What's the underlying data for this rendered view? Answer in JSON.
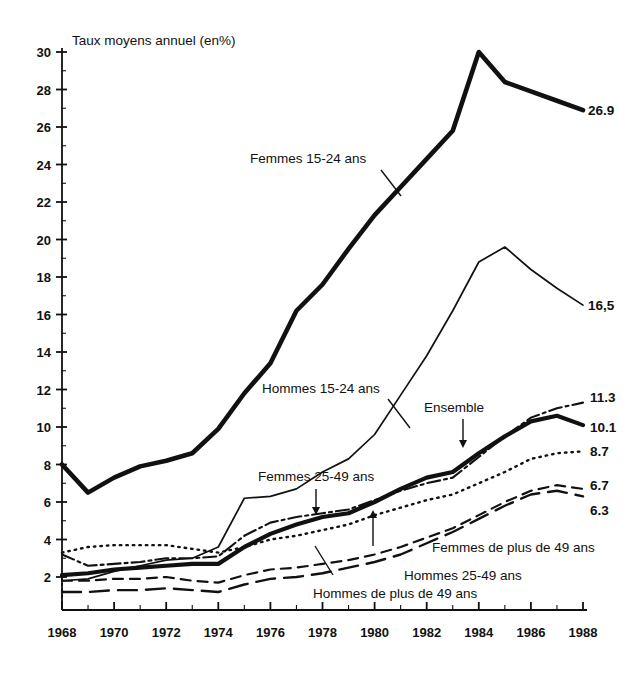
{
  "figure": {
    "axis_title": "Taux moyens annuel (en%)",
    "y_ticks": [
      "30",
      "28",
      "26",
      "24",
      "22",
      "20",
      "18",
      "16",
      "14",
      "12",
      "10",
      "8",
      "6",
      "4",
      "2"
    ],
    "x_ticks": [
      "1968",
      "1970",
      "1972",
      "1974",
      "1976",
      "1978",
      "1980",
      "1982",
      "1984",
      "1986",
      "1988"
    ]
  },
  "annotations": {
    "femmes_15_24": "Femmes 15-24 ans",
    "hommes_15_24": "Hommes 15-24 ans",
    "femmes_25_49": "Femmes 25-49 ans",
    "ensemble": "Ensemble",
    "femmes_plus_49": "Femmes de plus de 49 ans",
    "hommes_25_49": "Hommes 25-49 ans",
    "hommes_plus_49": "Hommes de plus de 49 ans"
  },
  "end_values": {
    "femmes_15_24": "26.9",
    "hommes_15_24": "16,5",
    "ensemble_upper": "11.3",
    "ensemble": "10.1",
    "femmes_25_49": "8.7",
    "femmes_plus_49": "6.7",
    "hommes_25_49": "6.3"
  },
  "chart_data": {
    "type": "line",
    "title": "Taux moyens annuel (en%)",
    "xlabel": "",
    "ylabel": "Taux moyens annuel (en%)",
    "xlim": [
      1968,
      1988
    ],
    "ylim": [
      0,
      30
    ],
    "grid": false,
    "legend": "inline-annotations",
    "x": [
      1968,
      1969,
      1970,
      1971,
      1972,
      1973,
      1974,
      1975,
      1976,
      1977,
      1978,
      1979,
      1980,
      1981,
      1982,
      1983,
      1984,
      1985,
      1986,
      1987,
      1988
    ],
    "series": [
      {
        "name": "Femmes 15-24 ans",
        "style": "thick-solid",
        "end_label": "26.9",
        "values": [
          8.0,
          6.5,
          7.3,
          7.9,
          8.2,
          8.6,
          9.9,
          11.8,
          13.4,
          16.2,
          17.6,
          19.5,
          21.3,
          22.8,
          24.3,
          25.8,
          30.0,
          28.4,
          27.9,
          27.4,
          26.9
        ]
      },
      {
        "name": "Hommes 15-24 ans",
        "style": "thin-solid",
        "end_label": "16,5",
        "values": [
          1.8,
          1.9,
          2.3,
          2.6,
          2.9,
          3.0,
          3.6,
          6.2,
          6.3,
          6.7,
          7.6,
          8.3,
          9.6,
          11.7,
          13.8,
          16.2,
          18.8,
          19.6,
          18.4,
          17.4,
          16.5
        ]
      },
      {
        "name": "Ensemble",
        "style": "thick-solid-lower",
        "end_label": "10.1",
        "values": [
          2.1,
          2.2,
          2.4,
          2.5,
          2.6,
          2.7,
          2.7,
          3.6,
          4.3,
          4.8,
          5.2,
          5.4,
          6.0,
          6.7,
          7.3,
          7.6,
          8.6,
          9.5,
          10.3,
          10.6,
          10.1
        ]
      },
      {
        "name": "Femmes 25-49 ans (dash-dot)",
        "style": "dash-dot",
        "end_label": "11.3",
        "values": [
          3.2,
          2.6,
          2.7,
          2.8,
          3.0,
          3.0,
          3.1,
          4.2,
          4.9,
          5.2,
          5.4,
          5.6,
          6.1,
          6.6,
          7.0,
          7.3,
          8.4,
          9.5,
          10.5,
          11.0,
          11.3
        ]
      },
      {
        "name": "Femmes 25-49 ans (dotted)",
        "style": "dotted",
        "end_label": "8.7",
        "values": [
          3.3,
          3.6,
          3.7,
          3.7,
          3.7,
          3.5,
          3.3,
          3.6,
          4.0,
          4.2,
          4.5,
          4.8,
          5.3,
          5.7,
          6.1,
          6.4,
          7.0,
          7.6,
          8.3,
          8.6,
          8.7
        ]
      },
      {
        "name": "Femmes de plus de 49 ans",
        "style": "dashed-short",
        "end_label": "6.7",
        "values": [
          1.8,
          1.8,
          1.9,
          1.9,
          2.0,
          1.8,
          1.7,
          2.1,
          2.4,
          2.5,
          2.7,
          2.9,
          3.2,
          3.6,
          4.1,
          4.6,
          5.3,
          6.0,
          6.6,
          6.9,
          6.7
        ]
      },
      {
        "name": "Hommes 25-49 ans",
        "style": "dashed-long",
        "end_label": "6.3",
        "values": [
          1.2,
          1.2,
          1.3,
          1.3,
          1.4,
          1.3,
          1.2,
          1.6,
          1.9,
          2.0,
          2.2,
          2.5,
          2.8,
          3.2,
          3.8,
          4.4,
          5.1,
          5.8,
          6.4,
          6.6,
          6.3
        ]
      }
    ]
  }
}
